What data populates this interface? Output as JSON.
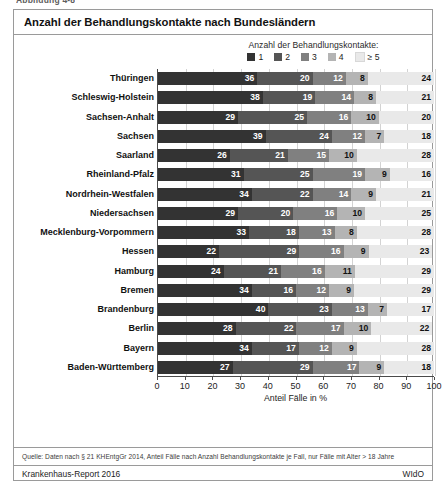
{
  "figure_caption": "Abbildung 4-8",
  "header": {
    "title": "Anzahl der Behandlungskontakte nach Bundesländern"
  },
  "legend": {
    "title": "Anzahl der Behandlungskontakte:",
    "items": [
      {
        "label": "1",
        "color": "#333333"
      },
      {
        "label": "2",
        "color": "#555555"
      },
      {
        "label": "3",
        "color": "#808080"
      },
      {
        "label": "4",
        "color": "#b4b4b4"
      },
      {
        "label": "≥ 5",
        "color": "#e9e9e9"
      }
    ]
  },
  "axis": {
    "x_title": "Anteil Fälle in %",
    "x_ticks": [
      "0",
      "10",
      "20",
      "30",
      "40",
      "50",
      "60",
      "70",
      "80",
      "90",
      "100"
    ]
  },
  "source": {
    "text": "Quelle: Daten nach § 21 KHEntgGr 2014, Anteil Fälle nach Anzahl Behandlungskontakte je Fall, nur Fälle mit Alter > 18 Jahre"
  },
  "footer": {
    "left": "Krankenhaus-Report 2016",
    "right": "WIdO"
  },
  "chart_data": {
    "type": "bar",
    "orientation": "horizontal",
    "stacked": true,
    "stack_mode": "percent",
    "title": "Anzahl der Behandlungskontakte nach Bundesländern",
    "xlabel": "Anteil Fälle in %",
    "ylabel": "",
    "xlim": [
      0,
      100
    ],
    "xticks": [
      0,
      10,
      20,
      30,
      40,
      50,
      60,
      70,
      80,
      90,
      100
    ],
    "grid": true,
    "grid_axis": "x",
    "legend_position": "top-right",
    "legend_title": "Anzahl der Behandlungskontakte:",
    "categories": [
      "Thüringen",
      "Schleswig-Holstein",
      "Sachsen-Anhalt",
      "Sachsen",
      "Saarland",
      "Rheinland-Pfalz",
      "Nordrhein-Westfalen",
      "Niedersachsen",
      "Mecklenburg-Vorpommern",
      "Hessen",
      "Hamburg",
      "Bremen",
      "Brandenburg",
      "Berlin",
      "Bayern",
      "Baden-Württemberg"
    ],
    "series": [
      {
        "name": "1",
        "color": "#333333",
        "values": [
          36,
          38,
          29,
          39,
          26,
          31,
          34,
          29,
          33,
          22,
          24,
          34,
          40,
          28,
          34,
          27
        ]
      },
      {
        "name": "2",
        "color": "#555555",
        "values": [
          20,
          19,
          25,
          24,
          21,
          25,
          22,
          20,
          18,
          29,
          21,
          16,
          23,
          22,
          17,
          29
        ]
      },
      {
        "name": "3",
        "color": "#808080",
        "values": [
          12,
          14,
          16,
          12,
          15,
          19,
          14,
          16,
          13,
          16,
          16,
          12,
          13,
          17,
          12,
          17
        ]
      },
      {
        "name": "4",
        "color": "#b4b4b4",
        "values": [
          8,
          8,
          10,
          7,
          10,
          9,
          9,
          10,
          8,
          9,
          11,
          9,
          7,
          10,
          9,
          9
        ]
      },
      {
        "name": "≥ 5",
        "color": "#e9e9e9",
        "values": [
          24,
          21,
          20,
          18,
          28,
          16,
          21,
          25,
          28,
          23,
          29,
          29,
          17,
          22,
          28,
          18
        ]
      }
    ]
  }
}
